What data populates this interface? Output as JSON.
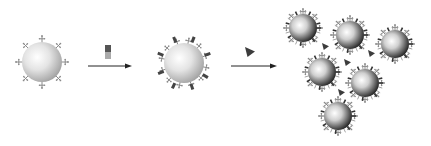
{
  "diagram": {
    "stages": [
      {
        "id": "stage-1",
        "label": "",
        "particle_style": "light",
        "ligands": [
          "branched-small"
        ]
      },
      {
        "id": "stage-2",
        "label": "",
        "particle_style": "light",
        "ligands": [
          "branched-small",
          "dark-bar"
        ]
      },
      {
        "id": "stage-3",
        "label": "",
        "particle_style": "dark-shaded",
        "particle_count": 6,
        "linker": "triangle"
      }
    ],
    "reagents": [
      {
        "id": "reagent-1",
        "shape": "square-bicolor",
        "colors": [
          "#555555",
          "#aaaaaa"
        ]
      },
      {
        "id": "reagent-2",
        "shape": "triangle",
        "color": "#444444"
      }
    ],
    "arrows": [
      {
        "id": "arrow-1",
        "direction": "right"
      },
      {
        "id": "arrow-2",
        "direction": "right"
      }
    ],
    "colors": {
      "background": "#ffffff",
      "ligand": "#8a8a8a",
      "dark_ligand": "#444444",
      "arrow": "#222222"
    }
  }
}
